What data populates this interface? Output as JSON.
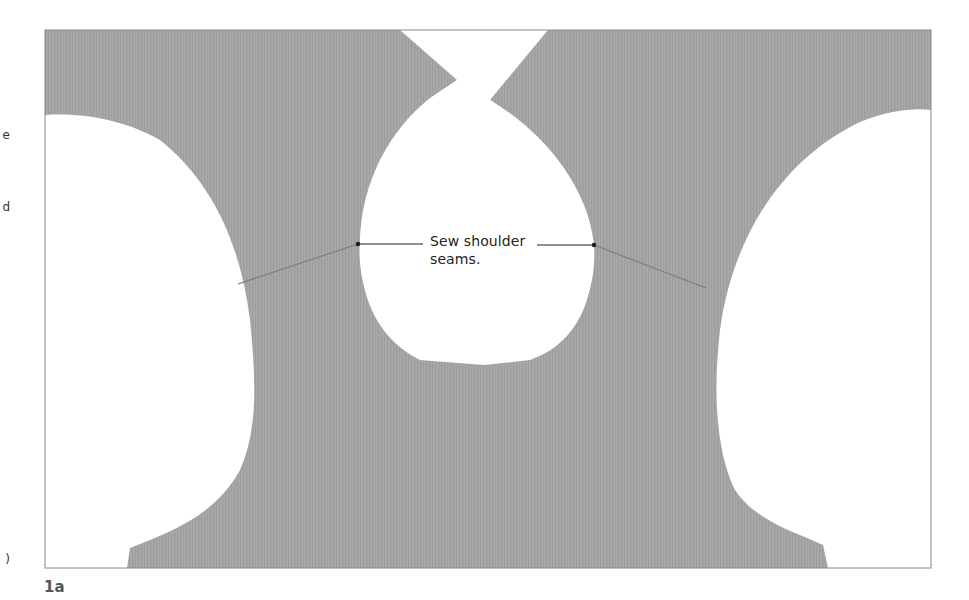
{
  "figure": {
    "caption": "1a",
    "fabric_color": "#a4a4a4",
    "background_color": "#ffffff",
    "frame_color": "#8a8a8a",
    "callout": {
      "line1": "Sew shoulder",
      "line2": "seams.",
      "leader_color": "#231f20"
    }
  },
  "margin_fragments": {
    "frag1": "e",
    "frag2": "d",
    "frag3": ")"
  }
}
